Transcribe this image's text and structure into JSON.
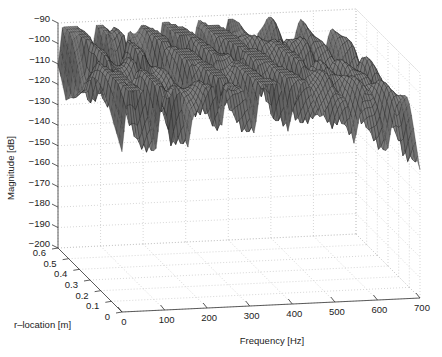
{
  "chart_data": {
    "type": "surface3d",
    "title": "",
    "xlabel": "Frequency [Hz]",
    "ylabel": "r–location [m]",
    "zlabel": "Magnitude [dB]",
    "x_ticks": [
      "0",
      "100",
      "200",
      "300",
      "400",
      "500",
      "600",
      "700"
    ],
    "y_ticks": [
      "0",
      "0.1",
      "0.2",
      "0.3",
      "0.4",
      "0.5",
      "0.6"
    ],
    "z_ticks": [
      "-90",
      "-100",
      "-110",
      "-120",
      "-130",
      "-140",
      "-150",
      "-160",
      "-170",
      "-180",
      "-190",
      "-200"
    ],
    "xlim": [
      0,
      700
    ],
    "ylim": [
      0,
      0.6
    ],
    "zlim": [
      -200,
      -90
    ],
    "grid": true,
    "colormap": "gray",
    "resonance_peaks_hz": [
      15,
      40,
      95,
      130,
      165,
      200,
      215,
      250,
      285,
      330,
      365,
      400,
      430,
      465,
      500,
      530,
      570,
      600,
      640,
      670
    ],
    "peak_magnitude_db_approx": [
      -110,
      -103,
      -110,
      -113,
      -120,
      -118,
      -112,
      -105,
      -115,
      -108,
      -106,
      -112,
      -118,
      -114,
      -120,
      -122,
      -124,
      -126,
      -128,
      -130
    ],
    "antiresonance_min_db_approx": -200
  },
  "axes": {
    "z_label": "Magnitude [dB]",
    "y_label": "r–location [m]",
    "x_label": "Frequency [Hz]"
  }
}
